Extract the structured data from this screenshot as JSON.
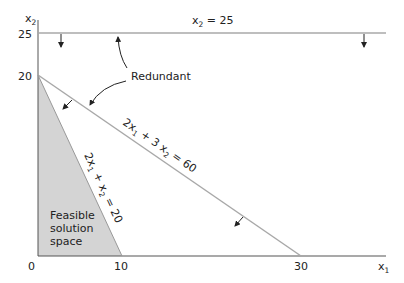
{
  "axes": {
    "y_label": "x",
    "y_label_sub": "2",
    "x_label": "x",
    "x_label_sub": "1",
    "y_ticks": [
      "25",
      "20"
    ],
    "x_ticks": [
      "0",
      "10",
      "30"
    ]
  },
  "constraints": {
    "c1": {
      "lhs": "x",
      "sub": "2",
      "rhs": " = 25"
    },
    "c2": {
      "p1": "2x",
      "s1": "1",
      "p2": " + 3 x",
      "s2": "2",
      "p3": " = 60"
    },
    "c3": {
      "p1": "2x",
      "s1": "1",
      "p2": " + x",
      "s2": "2",
      "p3": " = 20"
    }
  },
  "annotations": {
    "redundant": "Redundant",
    "feasible": [
      "Feasible",
      "solution",
      "space"
    ]
  },
  "colors": {
    "axis": "#555555",
    "constraint_line": "#a8a8a8",
    "feasible_fill": "#d4d4d4",
    "text": "#222222"
  }
}
